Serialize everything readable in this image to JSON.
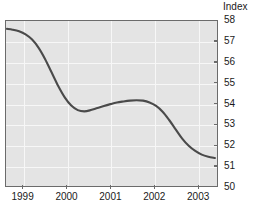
{
  "chart_data": {
    "type": "line",
    "title": "",
    "subtitle": "",
    "ylabel": "Index",
    "xlabel": "",
    "ylim": [
      50,
      58
    ],
    "xlim": [
      1998.6,
      2003.45
    ],
    "grid": true,
    "legend": null,
    "y_ticks": [
      58,
      57,
      56,
      55,
      54,
      53,
      52,
      51,
      50
    ],
    "x_ticks": [
      1999,
      2000,
      2001,
      2002,
      2003
    ],
    "x_tick_labels": [
      "1999",
      "2000",
      "2001",
      "2002",
      "2003"
    ],
    "series": [
      {
        "name": "Index",
        "color": "#4a4a4a",
        "x": [
          1998.62,
          1998.75,
          1998.9,
          1999.05,
          1999.2,
          1999.35,
          1999.5,
          1999.65,
          1999.8,
          1999.95,
          2000.1,
          2000.25,
          2000.4,
          2000.55,
          2000.7,
          2000.85,
          2001.0,
          2001.15,
          2001.3,
          2001.45,
          2001.6,
          2001.75,
          2001.9,
          2002.05,
          2002.2,
          2002.35,
          2002.5,
          2002.65,
          2002.8,
          2002.95,
          2003.1,
          2003.25,
          2003.4
        ],
        "y": [
          57.62,
          57.58,
          57.5,
          57.35,
          57.1,
          56.7,
          56.15,
          55.5,
          54.85,
          54.3,
          53.9,
          53.68,
          53.62,
          53.68,
          53.78,
          53.88,
          53.97,
          54.05,
          54.1,
          54.14,
          54.16,
          54.14,
          54.05,
          53.88,
          53.6,
          53.2,
          52.75,
          52.3,
          51.95,
          51.7,
          51.52,
          51.42,
          51.36
        ]
      }
    ]
  },
  "axis": {
    "index_title": "Index"
  }
}
